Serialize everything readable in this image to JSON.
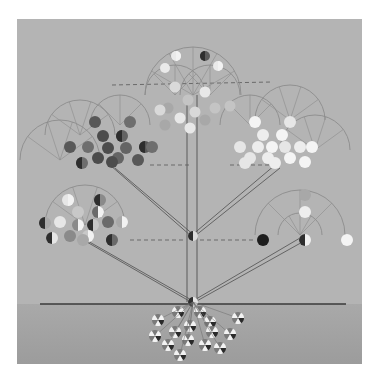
{
  "artwork": {
    "type": "abstract tree diagram in greyscale",
    "frame": {
      "x": 17,
      "y": 19,
      "w": 345,
      "h": 345,
      "color": "#b4b4b4"
    },
    "ground": {
      "y": 304,
      "color": "#a8a8a8"
    },
    "trunk_x": 193,
    "colors": {
      "line": "#5a5a5a",
      "arc": "#8c8c8c",
      "dash": "#6a6a6a",
      "dark": "#555555",
      "light": "#f0f0f0",
      "mid": "#9a9a9a"
    },
    "clusters": [
      {
        "name": "top",
        "cx": 193,
        "cy": 95,
        "tone": "mixed-light"
      },
      {
        "name": "upper-left",
        "cx": 110,
        "cy": 148,
        "tone": "dark"
      },
      {
        "name": "upper-right",
        "cx": 275,
        "cy": 148,
        "tone": "light"
      },
      {
        "name": "lower-left",
        "cx": 85,
        "cy": 218,
        "tone": "mixed"
      },
      {
        "name": "lower-right",
        "cx": 300,
        "cy": 225,
        "tone": "sparse"
      },
      {
        "name": "roots",
        "cx": 193,
        "cy": 330,
        "tone": "pinwheels"
      }
    ]
  }
}
